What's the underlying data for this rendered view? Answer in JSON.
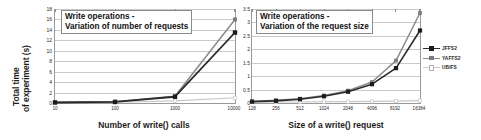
{
  "figure": {
    "series_colors": {
      "jffs2": "#2b2b2b",
      "yaffs2": "#8d8d8d",
      "ubifs": "#c8c8c8"
    },
    "legend": {
      "position": "right",
      "items": [
        {
          "label": "JFFS2",
          "color": "#2b2b2b",
          "marker": "filled-square"
        },
        {
          "label": "YAFFS2",
          "color": "#8d8d8d",
          "marker": "filled-square"
        },
        {
          "label": "UBIFS",
          "color": "#c8c8c8",
          "marker": "open-square"
        }
      ]
    }
  },
  "chart_data": [
    {
      "type": "line",
      "id": "left",
      "title": "Write operations -",
      "subtitle": "Variation of number of requests",
      "xlabel": "Number of write() calls",
      "ylabel": "Total time of experiment (s)",
      "ylabel_line1": "Total time",
      "ylabel_line2": "of experiment (s)",
      "categories": [
        "10",
        "100",
        "1000",
        "10000"
      ],
      "xticks": [
        "10",
        "100",
        "1000",
        "10000"
      ],
      "yticks": [
        "18",
        "16",
        "14",
        "12",
        "10",
        "8",
        "6",
        "4",
        "2",
        "0"
      ],
      "ylim": [
        0,
        18
      ],
      "grid": true,
      "series": [
        {
          "name": "JFFS2",
          "values": [
            0.1,
            0.2,
            1.2,
            13.5
          ]
        },
        {
          "name": "YAFFS2",
          "values": [
            0.15,
            0.25,
            1.3,
            16.0
          ]
        },
        {
          "name": "UBIFS",
          "values": [
            0.1,
            0.15,
            0.4,
            1.0
          ]
        }
      ]
    },
    {
      "type": "line",
      "id": "right",
      "title": "Write operations -",
      "subtitle": "Variation of the request size",
      "xlabel": "Size of a write() request",
      "ylabel": "",
      "categories": [
        "128",
        "256",
        "512",
        "1024",
        "2048",
        "4096",
        "8192",
        "16384"
      ],
      "xticks": [
        "128",
        "256",
        "512",
        "1024",
        "2048",
        "4096",
        "8192",
        "16384"
      ],
      "yticks": [
        "3.5",
        "3",
        "2.5",
        "2",
        "1.5",
        "1",
        "0.5",
        "0"
      ],
      "ylim": [
        0,
        3.5
      ],
      "grid": true,
      "series": [
        {
          "name": "JFFS2",
          "values": [
            0.05,
            0.08,
            0.14,
            0.25,
            0.42,
            0.7,
            1.3,
            2.7
          ]
        },
        {
          "name": "YAFFS2",
          "values": [
            0.06,
            0.1,
            0.16,
            0.28,
            0.46,
            0.78,
            1.58,
            3.35
          ]
        },
        {
          "name": "UBIFS",
          "values": [
            0.03,
            0.04,
            0.04,
            0.05,
            0.05,
            0.06,
            0.07,
            0.09
          ]
        }
      ]
    }
  ]
}
